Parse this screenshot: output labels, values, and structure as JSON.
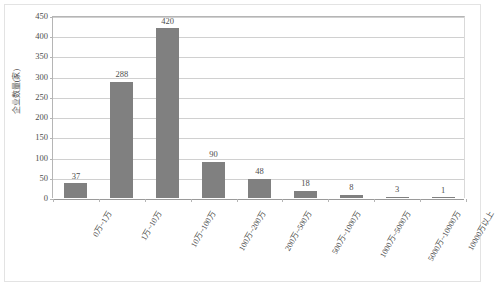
{
  "chart_data": {
    "type": "bar",
    "title": "",
    "subtitle": "",
    "xlabel": "",
    "ylabel": "企业数量(家)",
    "ylim": [
      0,
      450
    ],
    "ytick_step": 50,
    "yticks": [
      "450",
      "400",
      "350",
      "300",
      "250",
      "200",
      "150",
      "100",
      "50",
      "0"
    ],
    "grid": true,
    "legend": false,
    "legend_position": "none",
    "bar_color": "#808080",
    "gridline_color": "#d0d0d0",
    "axis_color": "#b5b5b5",
    "text_color": "#4d4d4d",
    "background": "#ffffff",
    "categories": [
      "0万~1万",
      "1万~10万",
      "10万~100万",
      "100万~200万",
      "200万~500万",
      "500万~1000万",
      "1000万~5000万",
      "5000万~10000万",
      "10000万以上"
    ],
    "values": [
      37,
      288,
      420,
      90,
      48,
      18,
      8,
      3,
      1
    ],
    "value_labels": [
      "37",
      "288",
      "420",
      "90",
      "48",
      "18",
      "8",
      "3",
      "1"
    ],
    "series": [
      {
        "name": "企业数量(家)",
        "values": [
          37,
          288,
          420,
          90,
          48,
          18,
          8,
          3,
          1
        ]
      }
    ]
  }
}
